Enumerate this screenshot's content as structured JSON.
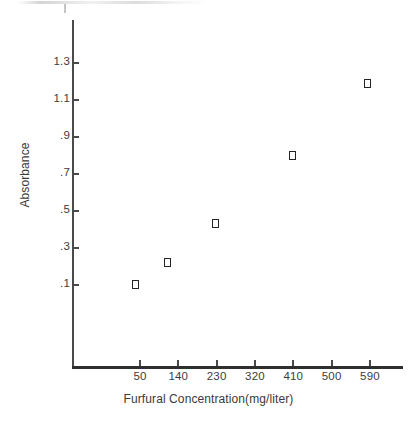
{
  "chart_data": {
    "type": "scatter",
    "title": "",
    "xlabel": "Furfural Concentration(mg/liter)",
    "ylabel": "Absorbance",
    "x": [
      40,
      115,
      227,
      407,
      585
    ],
    "y": [
      0.105,
      0.22,
      0.43,
      0.8,
      1.19
    ],
    "points": [
      {
        "x": 40,
        "y": 0.105
      },
      {
        "x": 115,
        "y": 0.22
      },
      {
        "x": 227,
        "y": 0.43
      },
      {
        "x": 407,
        "y": 0.8
      },
      {
        "x": 585,
        "y": 1.19
      }
    ],
    "xticks": [
      50,
      140,
      230,
      320,
      410,
      500,
      590
    ],
    "xtick_labels": [
      "50",
      "140",
      "230",
      "320",
      "410",
      "500",
      "590"
    ],
    "yticks": [
      0.1,
      0.3,
      0.5,
      0.7,
      0.9,
      1.1,
      1.3
    ],
    "ytick_labels": [
      ".1",
      ".3",
      ".5",
      ".7",
      ".9",
      "1.1",
      "1.3"
    ],
    "xlim": [
      5,
      650
    ],
    "ylim": [
      -0.1,
      1.48
    ],
    "grid": false,
    "legend": null,
    "marker": "open-square",
    "marker_color": "#232323",
    "axis_color": "#3a3a3a"
  }
}
